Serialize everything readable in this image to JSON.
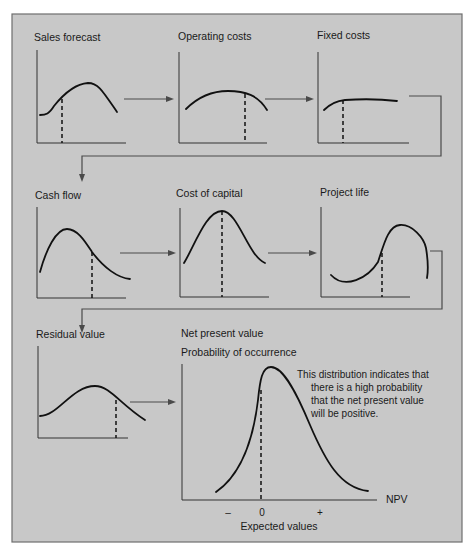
{
  "figure": {
    "background": "#c8c8c8",
    "border_color": "#6e6e6e",
    "curve_color": "#111111"
  },
  "panels": [
    {
      "id": "sales-forecast",
      "title": "Sales forecast",
      "title_pos": [
        34,
        41
      ],
      "axis": {
        "x0": 37,
        "y0": 50,
        "y1": 143,
        "x1": 126
      },
      "curve": "M40,115 C46,115 49,114 54,106 C62,96 74,84 88,83 C98,83 102,90 117,112",
      "dash": {
        "x": 62,
        "y_top": 99,
        "y_bottom": 143
      }
    },
    {
      "id": "operating-costs",
      "title": "Operating costs",
      "title_pos": [
        178,
        40
      ],
      "axis": {
        "x0": 179,
        "y0": 52,
        "y1": 143,
        "x1": 267
      },
      "curve": "M186,109 C200,95 215,91 228,91 C245,91 258,95 267,110",
      "dash": {
        "x": 245,
        "y_top": 94,
        "y_bottom": 143
      }
    },
    {
      "id": "fixed-costs",
      "title": "Fixed costs",
      "title_pos": [
        317,
        39
      ],
      "axis": {
        "x0": 318,
        "y0": 52,
        "y1": 143,
        "x1": 409
      },
      "curve": "M324,110 C330,104 336,101 345,100 C360,99 380,99 397,101",
      "dash": {
        "x": 343,
        "y_top": 100,
        "y_bottom": 143
      }
    },
    {
      "id": "cash-flow",
      "title": "Cash flow",
      "title_pos": [
        35,
        199
      ],
      "axis": {
        "x0": 37,
        "y0": 207,
        "y1": 298,
        "x1": 126
      },
      "curve": "M40,272 C46,250 56,229 67,229 C78,229 86,243 92,252 C104,268 118,278 130,279",
      "dash": {
        "x": 92,
        "y_top": 252,
        "y_bottom": 298
      }
    },
    {
      "id": "cost-of-capital",
      "title": "Cost of capital",
      "title_pos": [
        176,
        197
      ],
      "axis": {
        "x0": 180,
        "y0": 208,
        "y1": 297,
        "x1": 269
      },
      "curve": "M184,263 C195,245 206,211 222,211 C238,211 248,256 265,263",
      "dash": {
        "x": 222,
        "y_top": 211,
        "y_bottom": 297
      }
    },
    {
      "id": "project-life",
      "title": "Project life",
      "title_pos": [
        320,
        196
      ],
      "axis": {
        "x0": 321,
        "y0": 207,
        "y1": 297,
        "x1": 410
      },
      "curve": "M331,275 C345,290 368,278 378,262 C384,244 388,226 400,225 C412,224 424,238 426,248 C428,260 428,272 427,278",
      "dash": {
        "x": 382,
        "y_top": 253,
        "y_bottom": 297
      }
    },
    {
      "id": "residual-value",
      "title": "Residual value",
      "title_pos": [
        36,
        338
      ],
      "axis": {
        "x0": 38,
        "y0": 346,
        "y1": 438,
        "x1": 128
      },
      "curve": "M40,416 C58,416 72,386 95,386 C110,386 120,404 145,420",
      "dash": {
        "x": 116,
        "y_top": 400,
        "y_bottom": 438
      }
    }
  ],
  "npv_chart": {
    "title": "Net present value",
    "title_pos": [
      181,
      337
    ],
    "ylabel": "Probability of occurrence",
    "ylabel_pos": [
      181,
      356
    ],
    "axis": {
      "x0": 182,
      "y0": 364,
      "y1": 500,
      "x1": 377
    },
    "curve": "M216,492 C236,478 252,450 258,400 C260,380 262,367 271,367 C284,367 298,396 310,425 C325,460 340,488 368,491",
    "dash": {
      "x": 261,
      "y_top": 390,
      "y_bottom": 500
    },
    "npv_label": "NPV",
    "npv_label_pos": [
      386,
      503
    ],
    "ticks": [
      {
        "label": "–",
        "x": 228,
        "y": 516
      },
      {
        "label": "0",
        "x": 262,
        "y": 516
      },
      {
        "label": "+",
        "x": 320,
        "y": 516
      }
    ],
    "xlabel": "Expected values",
    "xlabel_pos": [
      279,
      530
    ],
    "note": [
      {
        "text": "This distribution indicates that",
        "x": 297,
        "y": 378
      },
      {
        "text": "there is a high probability",
        "x": 311,
        "y": 391
      },
      {
        "text": "that the net present value",
        "x": 311,
        "y": 404
      },
      {
        "text": "will be positive.",
        "x": 311,
        "y": 417
      }
    ]
  },
  "arrows": [
    {
      "id": "sales-to-operating",
      "from": [
        124,
        99
      ],
      "to": [
        174,
        99
      ]
    },
    {
      "id": "operating-to-fixed",
      "from": [
        265,
        99
      ],
      "to": [
        314,
        99
      ]
    },
    {
      "id": "cashflow-to-capital",
      "from": [
        120,
        253
      ],
      "to": [
        176,
        253
      ]
    },
    {
      "id": "capital-to-projectlife",
      "from": [
        268,
        253
      ],
      "to": [
        317,
        253
      ]
    },
    {
      "id": "residual-to-npv",
      "from": [
        130,
        402
      ],
      "to": [
        176,
        402
      ]
    }
  ],
  "connectors": [
    {
      "id": "row1-to-row2",
      "points": [
        [
          409,
          96
        ],
        [
          441,
          96
        ],
        [
          441,
          156
        ],
        [
          82,
          156
        ],
        [
          82,
          182
        ]
      ]
    },
    {
      "id": "row2-to-row3",
      "points": [
        [
          430,
          251
        ],
        [
          442,
          251
        ],
        [
          442,
          309
        ],
        [
          82,
          309
        ],
        [
          82,
          333
        ]
      ]
    }
  ],
  "chart_data": {
    "type": "diagram",
    "flow": [
      "Sales forecast",
      "Operating costs",
      "Fixed costs",
      "Cash flow",
      "Cost of capital",
      "Project life",
      "Residual value",
      "Net present value"
    ],
    "output_chart": {
      "type": "line",
      "title": "Net present value",
      "ylabel": "Probability of occurrence",
      "xlabel": "Expected values",
      "x_axis_name": "NPV",
      "x_ticks": [
        "–",
        "0",
        "+"
      ],
      "annotation": "This distribution indicates that there is a high probability that the net present value will be positive."
    }
  }
}
